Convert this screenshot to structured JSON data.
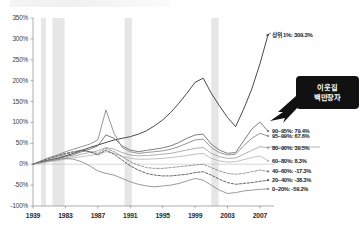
{
  "callout": {
    "line1": "이웃집",
    "line2": "백만장자"
  },
  "chart_data": {
    "type": "line",
    "title": "",
    "subtitle": "",
    "xlabel": "",
    "ylabel": "",
    "xlim": [
      1979,
      2008
    ],
    "ylim": [
      -100,
      350
    ],
    "ytick_labels": [
      "350%",
      "300%",
      "250%",
      "200%",
      "150%",
      "100%",
      "50%",
      "0%",
      "-50%",
      "-100%"
    ],
    "ytick_values": [
      350,
      300,
      250,
      200,
      150,
      100,
      50,
      0,
      -50,
      -100
    ],
    "xtick_labels": [
      "1939",
      "1983",
      "1987",
      "1991",
      "1995",
      "1999",
      "2003",
      "2007"
    ],
    "xtick_values": [
      1979,
      1983,
      1987,
      1991,
      1995,
      1999,
      2003,
      2007
    ],
    "grid": false,
    "legend_position": "right-end-labels",
    "annotations": [
      {
        "name": "top-one-percent-label",
        "text": "상위 1%: 309.3%",
        "x": 2008,
        "y": 309.3
      },
      {
        "name": "millionaire-next-door-callout",
        "text": "이웃집 백만장자",
        "points_to_x": 2006,
        "points_to_y": 100
      }
    ],
    "shaded_bands": [
      {
        "name": "recession-1980",
        "x0": 1980.0,
        "x1": 1980.6
      },
      {
        "name": "recession-1981-82",
        "x0": 1981.4,
        "x1": 1982.9
      },
      {
        "name": "recession-1990-91",
        "x0": 1990.3,
        "x1": 1991.2
      },
      {
        "name": "recession-2001",
        "x0": 2001.0,
        "x1": 2001.9
      }
    ],
    "x": [
      1979,
      1980,
      1981,
      1982,
      1983,
      1984,
      1985,
      1986,
      1987,
      1988,
      1989,
      1990,
      1991,
      1992,
      1993,
      1994,
      1995,
      1996,
      1997,
      1998,
      1999,
      2000,
      2001,
      2002,
      2003,
      2004,
      2005,
      2006,
      2007,
      2008
    ],
    "series": [
      {
        "name": "상위 1%",
        "label": "상위 1%: 309.3%",
        "end_value": 309.3,
        "color": "#4a4a4a",
        "style": "solid",
        "width": 1.0,
        "values": [
          0,
          6,
          10,
          14,
          20,
          26,
          33,
          40,
          46,
          52,
          58,
          62,
          66,
          72,
          80,
          92,
          106,
          124,
          146,
          170,
          196,
          206,
          170,
          140,
          112,
          90,
          132,
          180,
          240,
          309.3
        ]
      },
      {
        "name": "90~95%",
        "label": "90~95%: 79.4%",
        "end_value": 79.4,
        "color": "#6e6e6e",
        "style": "solid",
        "width": 0.9,
        "values": [
          0,
          5,
          9,
          13,
          18,
          23,
          30,
          36,
          44,
          70,
          62,
          44,
          34,
          30,
          33,
          36,
          39,
          44,
          52,
          62,
          70,
          72,
          48,
          34,
          26,
          28,
          56,
          84,
          101,
          79.4
        ]
      },
      {
        "name": "95~99%",
        "label": "95~99%: 67.6%",
        "end_value": 67.6,
        "color": "#8a8a8a",
        "style": "solid",
        "width": 0.9,
        "values": [
          0,
          8,
          16,
          22,
          30,
          36,
          42,
          48,
          58,
          130,
          74,
          40,
          30,
          26,
          28,
          30,
          32,
          36,
          42,
          50,
          58,
          60,
          40,
          28,
          22,
          24,
          44,
          62,
          74,
          67.6
        ]
      },
      {
        "name": "80~90%",
        "label": "80~90%: 39.5%",
        "end_value": 39.5,
        "color": "#9b9b9b",
        "style": "solid",
        "width": 0.8,
        "values": [
          0,
          4,
          8,
          11,
          15,
          19,
          24,
          28,
          32,
          40,
          36,
          28,
          22,
          20,
          21,
          22,
          24,
          26,
          30,
          34,
          38,
          40,
          26,
          18,
          14,
          15,
          24,
          33,
          42,
          39.5
        ]
      },
      {
        "name": "60~80%",
        "label": "60~80%: 8.3%",
        "end_value": 8.3,
        "color": "#b0b0b0",
        "style": "solid",
        "width": 0.8,
        "values": [
          0,
          3,
          6,
          9,
          12,
          15,
          18,
          21,
          24,
          30,
          26,
          19,
          14,
          12,
          12,
          13,
          14,
          16,
          18,
          21,
          24,
          26,
          14,
          8,
          5,
          6,
          11,
          16,
          20,
          8.3
        ]
      },
      {
        "name": "40~60%",
        "label": "40~60%: -17.3%",
        "end_value": -17.3,
        "color": "#7d7d7d",
        "style": "dashed",
        "width": 0.8,
        "values": [
          0,
          6,
          12,
          18,
          24,
          28,
          32,
          30,
          26,
          38,
          30,
          18,
          6,
          -2,
          -8,
          -10,
          -10,
          -8,
          -6,
          -4,
          -2,
          0,
          -8,
          -16,
          -22,
          -24,
          -22,
          -18,
          -14,
          -17.3
        ]
      },
      {
        "name": "20~40%",
        "label": "20~40%: -38.3%",
        "end_value": -38.3,
        "color": "#555555",
        "style": "dashed",
        "width": 0.9,
        "values": [
          0,
          7,
          14,
          20,
          26,
          30,
          34,
          30,
          22,
          34,
          24,
          10,
          -4,
          -14,
          -22,
          -26,
          -28,
          -28,
          -26,
          -24,
          -20,
          -18,
          -26,
          -36,
          -44,
          -48,
          -46,
          -44,
          -41,
          -38.3
        ]
      },
      {
        "name": "0~20%",
        "label": "0~20%: -59.2%",
        "end_value": -59.2,
        "color": "#8e8e8e",
        "style": "solid",
        "width": 0.9,
        "values": [
          0,
          4,
          8,
          11,
          14,
          12,
          6,
          -4,
          -16,
          -22,
          -26,
          -34,
          -42,
          -48,
          -52,
          -54,
          -52,
          -50,
          -46,
          -40,
          -34,
          -38,
          -50,
          -62,
          -70,
          -68,
          -64,
          -62,
          -60,
          -59.2
        ]
      }
    ]
  }
}
